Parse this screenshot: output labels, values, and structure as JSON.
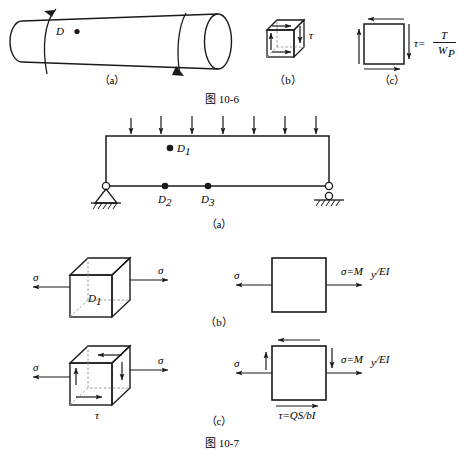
{
  "page": {
    "width": 464,
    "height": 461,
    "background": "#ffffff",
    "ink": "#1a1a1a"
  },
  "figure_10_6": {
    "caption": "图 10-6",
    "parts": {
      "a": {
        "sublabel": "（a）",
        "point_label": "D",
        "description": "circular shaft under torsion with two helical torque arrows"
      },
      "b": {
        "sublabel": "（b）",
        "stress_label": "τ",
        "description": "3D cubic element with pure shear stress arrows"
      },
      "c": {
        "sublabel": "（c）",
        "formula_lhs": "τ=",
        "formula_numerator": "T",
        "formula_denominator_base": "W",
        "formula_denominator_sub": "P",
        "description": "2D square element with circulating shear arrows"
      }
    }
  },
  "figure_10_7": {
    "caption": "图 10-7",
    "parts": {
      "a": {
        "sublabel": "（a）",
        "load_arrow_count": 7,
        "points": [
          {
            "name": "D1",
            "label_base": "D",
            "label_sub": "1"
          },
          {
            "name": "D2",
            "label_base": "D",
            "label_sub": "2"
          },
          {
            "name": "D3",
            "label_base": "D",
            "label_sub": "3"
          }
        ],
        "left_support": "pinned-support",
        "right_support": "roller-support",
        "description": "simply supported beam with uniformly distributed load"
      },
      "b": {
        "sublabel": "（b）",
        "cube_point_base": "D",
        "cube_point_sub": "1",
        "sigma_left": "σ",
        "sigma_right": "σ",
        "square_sigma_left": "σ",
        "formula_sigma": "σ=M",
        "formula_sigma_sub": "y",
        "formula_sigma_tail": "/EI",
        "description": "element at D1 in pure tension from bending"
      },
      "c": {
        "sublabel": "（c）",
        "sigma_left": "σ",
        "sigma_right": "σ",
        "tau_label": "τ",
        "square_sigma_left": "σ",
        "formula_sigma": "σ=M",
        "formula_sigma_sub": "y",
        "formula_sigma_tail": "/EI",
        "formula_tau": "τ=QS/bI",
        "description": "element with combined normal and shear stress"
      }
    }
  }
}
